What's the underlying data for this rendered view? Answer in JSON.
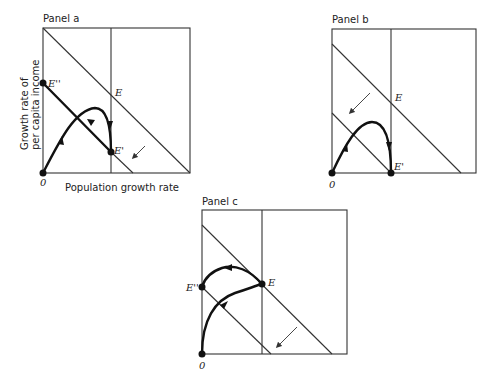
{
  "panels": [
    {
      "id": "a",
      "title": "Panel a",
      "points": {
        "origin": "0",
        "E": "E",
        "E_prime": "E'",
        "E_double_prime": "E''"
      }
    },
    {
      "id": "b",
      "title": "Panel b",
      "points": {
        "origin": "0",
        "E": "E",
        "E_prime": "E'"
      }
    },
    {
      "id": "c",
      "title": "Panel c",
      "points": {
        "origin": "0",
        "E": "E",
        "E_double_prime": "E''"
      }
    }
  ],
  "axes": {
    "x_label": "Population growth rate",
    "y_label_line1": "Growth rate of",
    "y_label_line2": "per capita income"
  }
}
